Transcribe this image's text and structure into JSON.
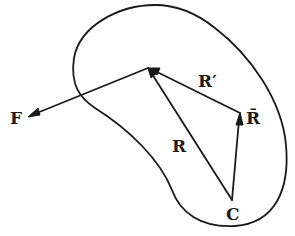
{
  "diagram": {
    "type": "vector-diagram",
    "colors": {
      "ink": "#1a1a1a",
      "background": "#ffffff"
    },
    "labels": {
      "force": "F",
      "position_r": "R",
      "position_r_prime": "R′",
      "position_r_bar": "R̄",
      "center": "C"
    },
    "points": {
      "C": [
        232,
        200
      ],
      "P": [
        148,
        68
      ],
      "R_bar_tip": [
        240,
        113
      ],
      "F_tip": [
        28,
        117
      ]
    },
    "vectors": [
      {
        "name": "R",
        "from": "C",
        "to": "P"
      },
      {
        "name": "R̄",
        "from": "C",
        "to": "R_bar_tip"
      },
      {
        "name": "R′",
        "from": "R_bar_tip",
        "to": "P"
      },
      {
        "name": "F",
        "from": "P",
        "to": "F_tip"
      }
    ]
  }
}
